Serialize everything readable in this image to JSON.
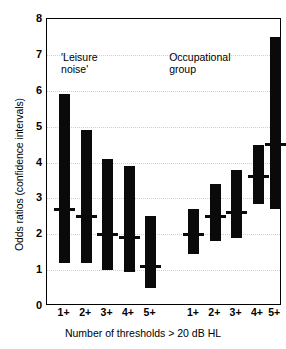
{
  "chart_data": {
    "type": "bar",
    "title": "",
    "subtitle": "",
    "xlabel": "Number of thresholds > 20 dB HL",
    "ylabel": "Odds ratios (confidence intervals)",
    "ylim": [
      0,
      8
    ],
    "yticks": [
      0,
      1,
      2,
      3,
      4,
      5,
      6,
      7,
      8
    ],
    "ytick_labels": [
      "0",
      "1",
      "2",
      "3",
      "4",
      "5",
      "6",
      "7",
      "8"
    ],
    "gridlines": [
      1,
      2,
      3,
      4,
      5,
      6,
      7
    ],
    "grid": true,
    "legend": "none",
    "legend_position": "none",
    "annotations": [
      {
        "text": "'Leisure\nnoise'",
        "x_frac": 0.06,
        "y_value": 7.1
      },
      {
        "text": "Occupational\ngroup",
        "x_frac": 0.52,
        "y_value": 7.1
      }
    ],
    "categories": [
      "1+",
      "2+",
      "3+",
      "4+",
      "5+",
      "1+",
      "2+",
      "3+",
      "4+",
      "5+"
    ],
    "groups": [
      {
        "name": "'Leisure noise'",
        "categories": [
          "1+",
          "2+",
          "3+",
          "4+",
          "5+"
        ],
        "point_estimates": [
          2.7,
          2.5,
          2.0,
          1.9,
          1.1
        ],
        "ci_lower": [
          1.2,
          1.2,
          1.0,
          0.95,
          0.5
        ],
        "ci_upper": [
          5.9,
          4.9,
          4.1,
          3.9,
          2.5
        ]
      },
      {
        "name": "Occupational group",
        "categories": [
          "1+",
          "2+",
          "3+",
          "4+",
          "5+"
        ],
        "point_estimates": [
          2.0,
          2.5,
          2.6,
          3.6,
          4.5
        ],
        "ci_lower": [
          1.45,
          1.8,
          1.9,
          2.85,
          2.7
        ],
        "ci_upper": [
          2.7,
          3.4,
          3.8,
          4.5,
          7.5
        ]
      }
    ],
    "bars": [
      {
        "group": "'Leisure noise'",
        "category": "1+",
        "estimate": 2.7,
        "low": 1.2,
        "high": 5.9
      },
      {
        "group": "'Leisure noise'",
        "category": "2+",
        "estimate": 2.5,
        "low": 1.2,
        "high": 4.9
      },
      {
        "group": "'Leisure noise'",
        "category": "3+",
        "estimate": 2.0,
        "low": 1.0,
        "high": 4.1
      },
      {
        "group": "'Leisure noise'",
        "category": "4+",
        "estimate": 1.9,
        "low": 0.95,
        "high": 3.9
      },
      {
        "group": "'Leisure noise'",
        "category": "5+",
        "estimate": 1.1,
        "low": 0.5,
        "high": 2.5
      },
      {
        "group": "Occupational group",
        "category": "1+",
        "estimate": 2.0,
        "low": 1.45,
        "high": 2.7
      },
      {
        "group": "Occupational group",
        "category": "2+",
        "estimate": 2.5,
        "low": 1.8,
        "high": 3.4
      },
      {
        "group": "Occupational group",
        "category": "3+",
        "estimate": 2.6,
        "low": 1.9,
        "high": 3.8
      },
      {
        "group": "Occupational group",
        "category": "4+",
        "estimate": 3.6,
        "low": 2.85,
        "high": 4.5
      },
      {
        "group": "Occupational group",
        "category": "5+",
        "estimate": 4.5,
        "low": 2.7,
        "high": 7.5
      }
    ],
    "bar_x_fractions": [
      0.075,
      0.167,
      0.258,
      0.349,
      0.441,
      0.625,
      0.716,
      0.807,
      0.898,
      0.971
    ],
    "colors": {
      "bar": "#0a0a0a",
      "axis": "#000000",
      "grid": "#cfcfcf",
      "background": "#ffffff",
      "text": "#000000"
    }
  }
}
